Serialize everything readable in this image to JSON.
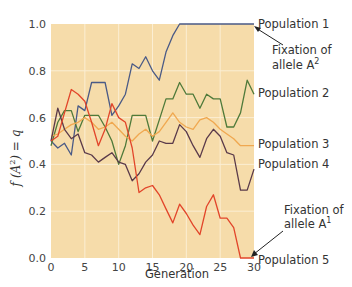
{
  "chart_data": {
    "type": "line",
    "title": "",
    "xlabel": "Generation",
    "ylabel": "f (A²) = q",
    "xlim": [
      0,
      30
    ],
    "ylim": [
      0.0,
      1.0
    ],
    "x_ticks": [
      "0",
      "5",
      "10",
      "15",
      "20",
      "25",
      "30"
    ],
    "y_ticks": [
      "0.0",
      "0.2",
      "0.4",
      "0.6",
      "0.8",
      "1.0"
    ],
    "grid": true,
    "background": "#f6dcaa",
    "x": [
      0,
      1,
      2,
      3,
      4,
      5,
      6,
      7,
      8,
      9,
      10,
      11,
      12,
      13,
      14,
      15,
      16,
      17,
      18,
      19,
      20,
      21,
      22,
      23,
      24,
      25,
      26,
      27,
      28,
      29,
      30
    ],
    "series": [
      {
        "name": "Population 1",
        "color": "#4a5a86",
        "values": [
          0.5,
          0.47,
          0.49,
          0.44,
          0.65,
          0.63,
          0.75,
          0.75,
          0.75,
          0.61,
          0.65,
          0.7,
          0.83,
          0.81,
          0.86,
          0.8,
          0.76,
          0.88,
          0.95,
          1.0,
          1.0,
          1.0,
          1.0,
          1.0,
          1.0,
          1.0,
          1.0,
          1.0,
          1.0,
          1.0,
          1.0
        ]
      },
      {
        "name": "Population 2",
        "color": "#4f7a3a",
        "values": [
          0.48,
          0.58,
          0.63,
          0.63,
          0.54,
          0.61,
          0.61,
          0.61,
          0.56,
          0.5,
          0.4,
          0.48,
          0.61,
          0.61,
          0.61,
          0.5,
          0.59,
          0.68,
          0.68,
          0.75,
          0.7,
          0.7,
          0.64,
          0.7,
          0.68,
          0.68,
          0.56,
          0.56,
          0.62,
          0.76,
          0.7
        ]
      },
      {
        "name": "Population 3",
        "color": "#f0a850",
        "values": [
          0.52,
          0.53,
          0.55,
          0.57,
          0.58,
          0.6,
          0.58,
          0.55,
          0.56,
          0.58,
          0.55,
          0.52,
          0.5,
          0.53,
          0.55,
          0.52,
          0.54,
          0.58,
          0.62,
          0.58,
          0.56,
          0.55,
          0.59,
          0.6,
          0.58,
          0.55,
          0.53,
          0.51,
          0.48,
          0.48,
          0.48
        ]
      },
      {
        "name": "Population 4",
        "color": "#5a3a4a",
        "values": [
          0.5,
          0.64,
          0.55,
          0.51,
          0.53,
          0.45,
          0.44,
          0.41,
          0.43,
          0.45,
          0.41,
          0.4,
          0.33,
          0.36,
          0.41,
          0.44,
          0.5,
          0.49,
          0.49,
          0.57,
          0.54,
          0.48,
          0.43,
          0.51,
          0.55,
          0.52,
          0.45,
          0.44,
          0.29,
          0.29,
          0.38
        ]
      },
      {
        "name": "Population 5",
        "color": "#e2452a",
        "values": [
          0.5,
          0.52,
          0.62,
          0.72,
          0.7,
          0.67,
          0.58,
          0.48,
          0.55,
          0.66,
          0.6,
          0.58,
          0.47,
          0.28,
          0.3,
          0.31,
          0.27,
          0.21,
          0.15,
          0.23,
          0.19,
          0.14,
          0.1,
          0.22,
          0.27,
          0.17,
          0.17,
          0.13,
          0.0,
          0.0,
          0.0
        ]
      }
    ],
    "annotations": [
      {
        "text": "Fixation of allele A²",
        "points_to": "Population 1 at generation 30, q = 1.0"
      },
      {
        "text": "Fixation of allele A¹",
        "points_to": "Population 5 at generation 30, q = 0.0"
      }
    ],
    "legend_position": "right (inline labels)"
  },
  "labels": {
    "pop1": "Population 1",
    "pop2": "Population 2",
    "pop3": "Population 3",
    "pop4": "Population 4",
    "pop5": "Population 5",
    "fix_a2_line1": "Fixation of",
    "fix_a2_line2": "allele A",
    "fix_a2_sup": "2",
    "fix_a1_line1": "Fixation of",
    "fix_a1_line2": "allele A",
    "fix_a1_sup": "1",
    "xlabel": "Generation",
    "ylabel_f": "f (A",
    "ylabel_sup": "2",
    "ylabel_rest": ") = q"
  }
}
